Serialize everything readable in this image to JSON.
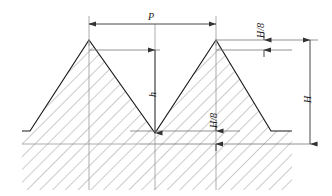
{
  "figure": {
    "kind": "thread-profile-diagram",
    "title": "",
    "background_color": "#ffffff",
    "line_color": "#1a1a1a",
    "dimension_color": "#555555",
    "hatch_color": "#777777"
  },
  "labels": {
    "pitch": "P",
    "height_over_eight_top": "H/8",
    "full_height": "H",
    "thread_depth": "h",
    "height_over_eight_root": "H/8"
  },
  "geometry": {
    "crest_left_x": 89,
    "crest_right_x": 216,
    "crest_y": 40,
    "flank_top_y": 50,
    "root_y": 133,
    "root_line_y": 131,
    "base_y": 144,
    "bottom_y": 190,
    "left_edge_x": 22,
    "right_edge_x": 292,
    "pitch_dim_y": 24,
    "h_dim_x": 155,
    "big_h_dim_x": 310,
    "h8_top_dim_x": 264,
    "h8_root_dim_x": 216
  }
}
